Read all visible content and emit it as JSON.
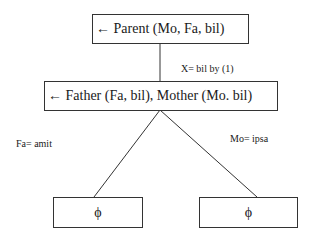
{
  "diagram": {
    "root": {
      "label": "← Parent (Mo, Fa, bil)"
    },
    "edge_root_child": {
      "label": "X= bil  by (1)"
    },
    "child": {
      "label": "← Father (Fa, bil), Mother (Mo. bil)"
    },
    "edge_left": {
      "label": "Fa= amit"
    },
    "edge_right": {
      "label": "Mo= ipsa"
    },
    "leaf_left": {
      "label": "ϕ"
    },
    "leaf_right": {
      "label": "ϕ"
    }
  }
}
